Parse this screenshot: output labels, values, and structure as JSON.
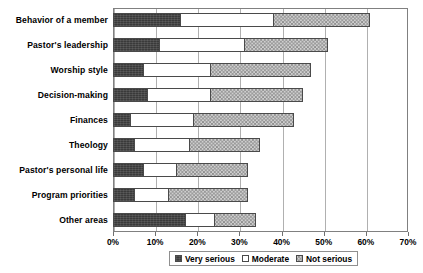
{
  "chart_data": {
    "type": "bar",
    "orientation": "horizontal",
    "stacked": true,
    "title": "",
    "xlabel": "",
    "ylabel": "",
    "xlim": [
      0,
      70
    ],
    "xtick_labels": [
      "0%",
      "10%",
      "20%",
      "30%",
      "40%",
      "50%",
      "60%",
      "70%"
    ],
    "xticks": [
      0,
      10,
      20,
      30,
      40,
      50,
      60,
      70
    ],
    "grid": true,
    "legend_position": "bottom",
    "categories": [
      "Behavior of a member",
      "Pastor's leadership",
      "Worship style",
      "Decision-making",
      "Finances",
      "Theology",
      "Pastor's personal life",
      "Program priorities",
      "Other areas"
    ],
    "series": [
      {
        "name": "Very serious",
        "color": "#3a3a3a",
        "values": [
          16,
          11,
          7,
          8,
          4,
          5,
          7,
          5,
          17
        ]
      },
      {
        "name": "Moderate",
        "color": "#ffffff",
        "values": [
          22,
          20,
          16,
          15,
          15,
          13,
          8,
          8,
          7
        ]
      },
      {
        "name": "Not serious",
        "color": "#cfcfcf",
        "values": [
          23,
          20,
          24,
          22,
          24,
          17,
          17,
          19,
          10
        ]
      }
    ],
    "totals": [
      61,
      51,
      47,
      45,
      43,
      35,
      32,
      32,
      34
    ]
  },
  "legend": {
    "items": [
      {
        "label": "Very serious",
        "swatch": "very-serious-swatch"
      },
      {
        "label": "Moderate",
        "swatch": "moderate-swatch"
      },
      {
        "label": "Not serious",
        "swatch": "not-serious-swatch"
      }
    ]
  }
}
